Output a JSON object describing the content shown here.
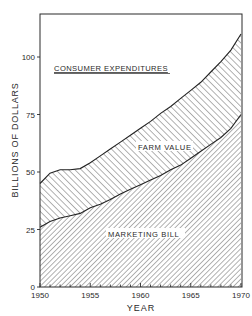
{
  "chart_data": {
    "type": "area",
    "stacked": true,
    "title": "",
    "xlabel": "YEAR",
    "ylabel": "BILLIONS OF DOLLARS",
    "xlim": [
      1950,
      1970
    ],
    "ylim": [
      0,
      119
    ],
    "x_ticks": [
      1950,
      1955,
      1960,
      1965,
      1970
    ],
    "y_ticks": [
      0,
      25,
      50,
      75,
      100
    ],
    "grid": false,
    "legend": "inline labels",
    "x": [
      1950,
      1951,
      1952,
      1953,
      1954,
      1955,
      1956,
      1957,
      1958,
      1959,
      1960,
      1961,
      1962,
      1963,
      1964,
      1965,
      1966,
      1967,
      1968,
      1969,
      1970
    ],
    "series": [
      {
        "name": "MARKETING BILL",
        "description": "lower hatched region (from 0 up to this line)",
        "values": [
          26,
          28.5,
          30,
          31,
          32,
          34.5,
          36,
          38,
          40.5,
          42.5,
          44.5,
          46.5,
          48.5,
          51,
          53,
          56,
          59,
          62,
          65,
          69,
          75
        ]
      },
      {
        "name": "CONSUMER EXPENDITURES",
        "description": "top line; region between this and marketing bill is FARM VALUE",
        "values": [
          45,
          49.5,
          51,
          51,
          51.5,
          54,
          57,
          60,
          63,
          66,
          69,
          72,
          75.5,
          78.5,
          82,
          85.5,
          89,
          93.5,
          98,
          103,
          110
        ]
      }
    ],
    "regions": [
      {
        "name": "FARM VALUE",
        "between": [
          "MARKETING BILL",
          "CONSUMER EXPENDITURES"
        ],
        "hatch": "backslash"
      },
      {
        "name": "MARKETING BILL",
        "between": [
          "axis",
          "MARKETING BILL"
        ],
        "hatch": "slash"
      }
    ],
    "annotations": [
      {
        "text": "CONSUMER EXPENDITURES",
        "underlined": true
      },
      {
        "text": "FARM VALUE"
      },
      {
        "text": "MARKETING BILL"
      }
    ]
  },
  "labels": {
    "y_axis": "BILLIONS OF DOLLARS",
    "x_axis": "YEAR",
    "consumer": "CONSUMER EXPENDITURES",
    "farm": "FARM VALUE",
    "marketing": "MARKETING BILL",
    "y_ticks": [
      "0",
      "25",
      "50",
      "75",
      "100"
    ],
    "x_ticks": [
      "1950",
      "1955",
      "1960",
      "1965",
      "1970"
    ]
  },
  "colors": {
    "ink": "#2a2a2a",
    "hatch": "#555555",
    "background": "#ffffff"
  }
}
